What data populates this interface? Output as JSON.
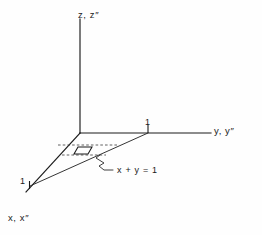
{
  "figure": {
    "kind": "3d-coordinate-axes-diagram",
    "background_color": "#fefefe",
    "ink_color": "#1a1a1a",
    "axes": [
      {
        "id": "z-axis",
        "label": "z, z″",
        "direction": "vertical-up",
        "description": "vertical axis drawn upward from the origin"
      },
      {
        "id": "y-axis",
        "label": "y, y″",
        "direction": "horizontal-right",
        "description": "horizontal axis drawn to the right of the origin"
      },
      {
        "id": "x-axis",
        "label": "x, x″",
        "direction": "oblique-down-left",
        "description": "oblique axis drawn toward the lower left, representing depth"
      }
    ],
    "ticks": [
      {
        "id": "y-unit-tick",
        "axis": "y-axis",
        "label": "1",
        "value": 1
      },
      {
        "id": "x-unit-tick",
        "axis": "x-axis",
        "label": "1",
        "value": 1
      }
    ],
    "annotations": [
      {
        "id": "constraint-annotation",
        "label": "x + y = 1",
        "description": "leader line pointing to the slanted boundary line joining the unit marks on the x and y axes"
      }
    ],
    "elements": [
      {
        "id": "area-element",
        "shape": "parallelogram",
        "description": "small differential area element lying in the x-y plane inside the triangular region"
      },
      {
        "id": "dashed-guides",
        "shape": "dashed-horizontal-lines",
        "description": "dashed construction lines extending from the area element toward the region boundaries"
      }
    ]
  }
}
